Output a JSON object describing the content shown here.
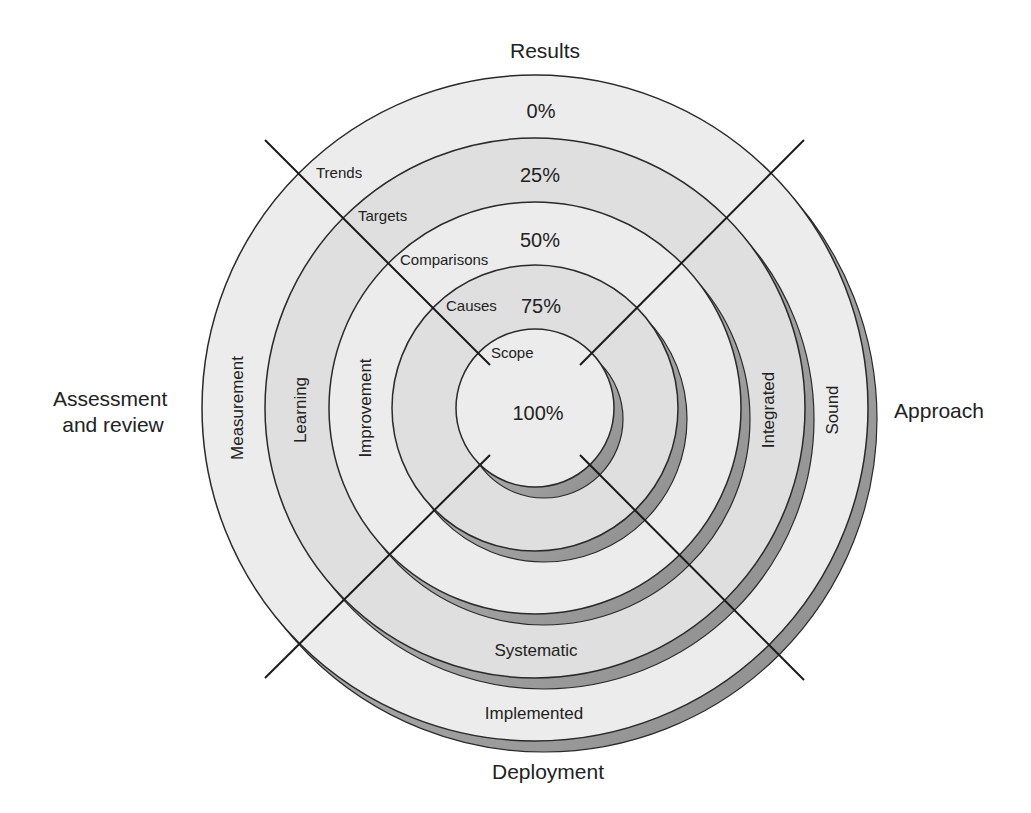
{
  "diagram": {
    "type": "concentric-rings-with-quadrants",
    "center": {
      "x": 535,
      "y": 408
    },
    "shadow_offset": {
      "dx": 9,
      "dy": 11
    },
    "colors": {
      "background": "#ffffff",
      "ring_light": "#ececec",
      "ring_dark": "#dfdfdf",
      "shadow": "#9a9a9a",
      "stroke": "#2a2a2a",
      "text": "#222222"
    },
    "rings": [
      {
        "radius": 333,
        "percent_label": "0%",
        "fill": "light",
        "percent_pos": {
          "x": 541,
          "y": 118
        }
      },
      {
        "radius": 270,
        "percent_label": "25%",
        "fill": "dark",
        "percent_pos": {
          "x": 540,
          "y": 182
        }
      },
      {
        "radius": 206,
        "percent_label": "50%",
        "fill": "light",
        "percent_pos": {
          "x": 540,
          "y": 247
        }
      },
      {
        "radius": 143,
        "percent_label": "75%",
        "fill": "dark",
        "percent_pos": {
          "x": 541,
          "y": 313
        }
      },
      {
        "radius": 79,
        "percent_label": "100%",
        "fill": "light",
        "percent_pos": {
          "x": 538,
          "y": 420
        }
      }
    ],
    "axes": {
      "top": {
        "label": "Results",
        "x": 545,
        "y": 58
      },
      "right": {
        "label": "Approach",
        "x": 939,
        "y": 418
      },
      "bottom": {
        "label": "Deployment",
        "x": 548,
        "y": 779
      },
      "left": {
        "lines": [
          "Assessment",
          "and review"
        ],
        "x": 113,
        "y": 406
      }
    },
    "quadrant_lines": [
      {
        "name": "upper-left",
        "x1": 265,
        "y1": 140,
        "x2": 490,
        "y2": 365
      },
      {
        "name": "upper-right",
        "x1": 804,
        "y1": 140,
        "x2": 580,
        "y2": 365
      },
      {
        "name": "lower-left",
        "x1": 490,
        "y1": 455,
        "x2": 265,
        "y2": 678
      },
      {
        "name": "lower-right",
        "x1": 580,
        "y1": 455,
        "x2": 804,
        "y2": 680
      }
    ],
    "results_labels": [
      {
        "text": "Trends",
        "x": 316,
        "y": 178
      },
      {
        "text": "Targets",
        "x": 358,
        "y": 221
      },
      {
        "text": "Comparisons",
        "x": 400,
        "y": 265
      },
      {
        "text": "Causes",
        "x": 446,
        "y": 311
      },
      {
        "text": "Scope",
        "x": 491,
        "y": 358
      }
    ],
    "assessment_labels": [
      {
        "text": "Measurement",
        "x": 237,
        "y": 408
      },
      {
        "text": "Learning",
        "x": 300,
        "y": 410
      },
      {
        "text": "Improvement",
        "x": 365,
        "y": 408
      }
    ],
    "approach_labels": [
      {
        "text": "Integrated",
        "x": 768,
        "y": 410
      },
      {
        "text": "Sound",
        "x": 832,
        "y": 410
      }
    ],
    "deployment_labels": [
      {
        "text": "Systematic",
        "x": 536,
        "y": 656
      },
      {
        "text": "Implemented",
        "x": 534,
        "y": 719
      }
    ]
  }
}
